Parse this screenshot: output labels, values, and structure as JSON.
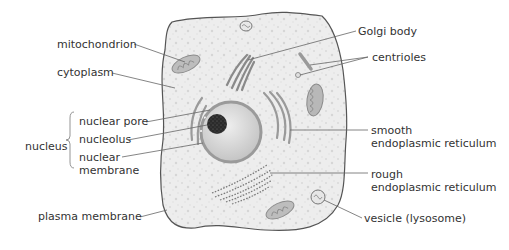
{
  "diagram": {
    "colors": {
      "cytoplasm_fill": "#ececec",
      "cell_outline": "#555555",
      "organelle_fill": "#bdbdbd",
      "organelle_stroke": "#8a8a8a",
      "nucleus_fill": "#d9d9d9",
      "nucleolus_fill": "#2a2a2a",
      "leader_line": "#666666",
      "text": "#333333"
    },
    "labels": {
      "mitochondrion": "mitochondrion",
      "cytoplasm": "cytoplasm",
      "nucleus": "nucleus",
      "nuclear_pore": "nuclear pore",
      "nucleolus": "nucleolus",
      "nuclear_membrane_line1": "nuclear",
      "nuclear_membrane_line2": "membrane",
      "plasma_membrane": "plasma membrane",
      "golgi_body": "Golgi body",
      "centrioles": "centrioles",
      "smooth_er_line1": "smooth",
      "smooth_er_line2": "endoplasmic reticulum",
      "rough_er_line1": "rough",
      "rough_er_line2": "endoplasmic reticulum",
      "vesicle": "vesicle (lysosome)"
    }
  }
}
